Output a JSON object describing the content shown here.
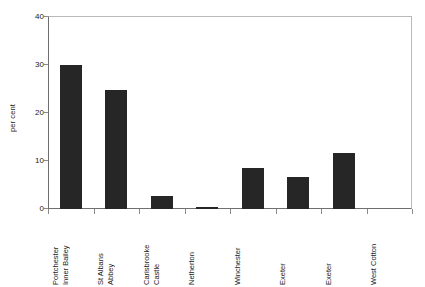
{
  "chart_data": {
    "type": "bar",
    "title": "",
    "xlabel": "",
    "ylabel": "per cent",
    "ylim": [
      0,
      40
    ],
    "yticks": [
      0,
      10,
      20,
      30,
      40
    ],
    "ytick_labels": [
      "0",
      "10",
      "20",
      "30",
      "40"
    ],
    "grid": false,
    "legend": "none",
    "categories": [
      "Portchester\nInner Bailey",
      "St Albans\nAbbey",
      "Carisbrooke\nCastle",
      "Netherton",
      "Winchester",
      "Exeter",
      "Exeter",
      "West Cotton"
    ],
    "values": [
      29.9,
      24.7,
      2.6,
      0.5,
      8.5,
      6.7,
      11.7,
      0
    ],
    "bar_color": "#262626"
  }
}
